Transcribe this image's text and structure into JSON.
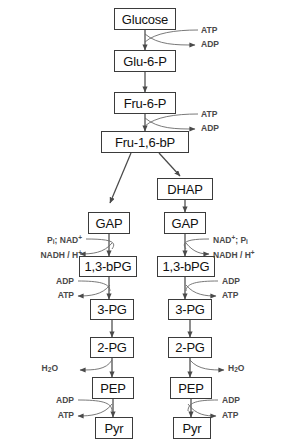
{
  "diagram": {
    "type": "flowchart",
    "colors": {
      "box_border": "#3b3b3b",
      "box_fill": "#ffffff",
      "arrow": "#4a4a4a",
      "label_text": "#4a4a4a",
      "node_text": "#111111",
      "background": "#ffffff"
    },
    "nodes": [
      {
        "id": "glucose",
        "label": "Glucose",
        "x": 114,
        "y": 8,
        "w": 62,
        "h": 22
      },
      {
        "id": "glu6p",
        "label": "Glu-6-P",
        "x": 114,
        "y": 50,
        "w": 62,
        "h": 22
      },
      {
        "id": "fru6p",
        "label": "Fru-6-P",
        "x": 114,
        "y": 92,
        "w": 62,
        "h": 22
      },
      {
        "id": "fru16bp",
        "label": "Fru-1,6-bP",
        "x": 101,
        "y": 131,
        "w": 88,
        "h": 22
      },
      {
        "id": "dhap",
        "label": "DHAP",
        "x": 157,
        "y": 178,
        "w": 56,
        "h": 22
      },
      {
        "id": "gap_left",
        "label": "GAP",
        "x": 88,
        "y": 212,
        "w": 42,
        "h": 22
      },
      {
        "id": "gap_right",
        "label": "GAP",
        "x": 164,
        "y": 212,
        "w": 42,
        "h": 22
      },
      {
        "id": "bpg_left",
        "label": "1,3-bPG",
        "x": 79,
        "y": 256,
        "w": 58,
        "h": 21
      },
      {
        "id": "bpg_right",
        "label": "1,3-bPG",
        "x": 157,
        "y": 256,
        "w": 58,
        "h": 21
      },
      {
        "id": "pg3_left",
        "label": "3-PG",
        "x": 90,
        "y": 299,
        "w": 44,
        "h": 21
      },
      {
        "id": "pg3_right",
        "label": "3-PG",
        "x": 168,
        "y": 299,
        "w": 44,
        "h": 21
      },
      {
        "id": "pg2_left",
        "label": "2-PG",
        "x": 90,
        "y": 337,
        "w": 44,
        "h": 21
      },
      {
        "id": "pg2_right",
        "label": "2-PG",
        "x": 168,
        "y": 337,
        "w": 44,
        "h": 21
      },
      {
        "id": "pep_left",
        "label": "PEP",
        "x": 92,
        "y": 377,
        "w": 42,
        "h": 22
      },
      {
        "id": "pep_right",
        "label": "PEP",
        "x": 170,
        "y": 377,
        "w": 42,
        "h": 22
      },
      {
        "id": "pyr_left",
        "label": "Pyr",
        "x": 95,
        "y": 417,
        "w": 38,
        "h": 22
      },
      {
        "id": "pyr_right",
        "label": "Pyr",
        "x": 173,
        "y": 417,
        "w": 38,
        "h": 22
      }
    ],
    "cofactors": [
      {
        "id": "atp-in-hexokinase",
        "html": "ATP",
        "x": 201,
        "y": 26,
        "side": "right"
      },
      {
        "id": "adp-out-hexokinase",
        "html": "ADP",
        "x": 201,
        "y": 40,
        "side": "right"
      },
      {
        "id": "atp-in-pfk",
        "html": "ATP",
        "x": 201,
        "y": 110,
        "side": "right"
      },
      {
        "id": "adp-out-pfk",
        "html": "ADP",
        "x": 201,
        "y": 124,
        "side": "right"
      },
      {
        "id": "pi-nad-left",
        "html": "P<sub>i</sub>; NAD<sup>+</sup>",
        "x": 82,
        "y": 235,
        "side": "left"
      },
      {
        "id": "nadh-h-left",
        "html": "NADH / H<sup>+</sup>",
        "x": 82,
        "y": 250,
        "side": "left"
      },
      {
        "id": "nad-pi-right",
        "html": "NAD<sup>+</sup>; P<sub>i</sub>",
        "x": 213,
        "y": 235,
        "side": "right"
      },
      {
        "id": "nadh-h-right",
        "html": "NADH / H<sup>+</sup>",
        "x": 213,
        "y": 250,
        "side": "right"
      },
      {
        "id": "adp-in-pgk-left",
        "html": "ADP",
        "x": 74,
        "y": 277,
        "side": "left"
      },
      {
        "id": "atp-out-pgk-left",
        "html": "ATP",
        "x": 74,
        "y": 291,
        "side": "left"
      },
      {
        "id": "adp-in-pgk-right",
        "html": "ADP",
        "x": 222,
        "y": 277,
        "side": "right"
      },
      {
        "id": "atp-out-pgk-right",
        "html": "ATP",
        "x": 222,
        "y": 291,
        "side": "right"
      },
      {
        "id": "h2o-out-left",
        "html": "H<sub>2</sub>O",
        "x": 58,
        "y": 364,
        "side": "left"
      },
      {
        "id": "h2o-out-right",
        "html": "H<sub>2</sub>O",
        "x": 228,
        "y": 364,
        "side": "right"
      },
      {
        "id": "adp-in-pk-left",
        "html": "ADP",
        "x": 74,
        "y": 396,
        "side": "left"
      },
      {
        "id": "atp-out-pk-left",
        "html": "ATP",
        "x": 74,
        "y": 411,
        "side": "left"
      },
      {
        "id": "adp-in-pk-right",
        "html": "ADP",
        "x": 222,
        "y": 396,
        "side": "right"
      },
      {
        "id": "atp-out-pk-right",
        "html": "ATP",
        "x": 222,
        "y": 411,
        "side": "right"
      }
    ],
    "main_arrows": [
      {
        "id": "glucose-to-glu6p",
        "x1": 145,
        "y1": 30,
        "x2": 145,
        "y2": 50
      },
      {
        "id": "glu6p-to-fru6p",
        "x1": 145,
        "y1": 72,
        "x2": 145,
        "y2": 92
      },
      {
        "id": "fru6p-to-fru16bp",
        "x1": 145,
        "y1": 114,
        "x2": 145,
        "y2": 131
      },
      {
        "id": "fru16bp-to-gap",
        "x1": 131,
        "y1": 153,
        "x2": 110,
        "y2": 203
      },
      {
        "id": "fru16bp-to-dhap",
        "x1": 159,
        "y1": 153,
        "x2": 180,
        "y2": 176
      },
      {
        "id": "dhap-to-gap",
        "x1": 185,
        "y1": 200,
        "x2": 185,
        "y2": 212
      },
      {
        "id": "gap-to-bpg-left",
        "x1": 109,
        "y1": 234,
        "x2": 109,
        "y2": 256
      },
      {
        "id": "gap-to-bpg-right",
        "x1": 185,
        "y1": 234,
        "x2": 185,
        "y2": 256
      },
      {
        "id": "bpg-to-3pg-left",
        "x1": 109,
        "y1": 277,
        "x2": 109,
        "y2": 299
      },
      {
        "id": "bpg-to-3pg-right",
        "x1": 185,
        "y1": 277,
        "x2": 185,
        "y2": 299
      },
      {
        "id": "3pg-to-2pg-left",
        "x1": 112,
        "y1": 320,
        "x2": 112,
        "y2": 337
      },
      {
        "id": "3pg-to-2pg-right",
        "x1": 190,
        "y1": 320,
        "x2": 190,
        "y2": 337
      },
      {
        "id": "2pg-to-pep-left",
        "x1": 112,
        "y1": 358,
        "x2": 112,
        "y2": 377
      },
      {
        "id": "2pg-to-pep-right",
        "x1": 190,
        "y1": 358,
        "x2": 190,
        "y2": 377
      },
      {
        "id": "pep-to-pyr-left",
        "x1": 113,
        "y1": 399,
        "x2": 113,
        "y2": 417
      },
      {
        "id": "pep-to-pyr-right",
        "x1": 191,
        "y1": 399,
        "x2": 191,
        "y2": 417
      }
    ]
  }
}
